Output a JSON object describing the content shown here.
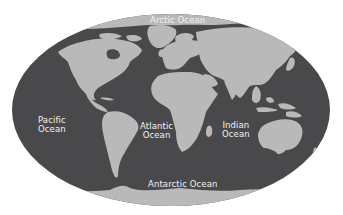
{
  "map": {
    "type": "world-ocean-map",
    "projection": "elliptical",
    "colors": {
      "background": "#ffffff",
      "ocean": "#4a4a4c",
      "land": "#b9b9b9",
      "ice": "#bdbdbd",
      "label": "#f2f2f2"
    },
    "labels": {
      "arctic": {
        "line1": "Arctic Ocean"
      },
      "pacific": {
        "line1": "Pacific",
        "line2": "Ocean"
      },
      "atlantic": {
        "line1": "Atlantic",
        "line2": "Ocean"
      },
      "indian": {
        "line1": "Indian",
        "line2": "Ocean"
      },
      "antarctic": {
        "line1": "Antarctic Ocean"
      }
    }
  }
}
